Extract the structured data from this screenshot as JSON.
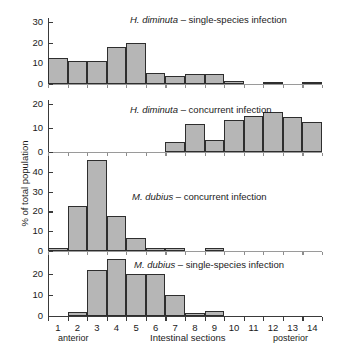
{
  "figure": {
    "ylabel": "% of total population",
    "xlabel": "Intestinal sections",
    "anterior_label": "anterior",
    "posterior_label": "posterior",
    "bar_fill": "#b6b6b6",
    "bar_stroke": "#2e2e2e",
    "axis_color": "#3a3a3a"
  },
  "chart_data": [
    {
      "type": "bar",
      "title": "H. diminuta – single-species infection",
      "title_italic": "H. diminuta",
      "title_rest": " – single-species infection",
      "xlabel": "Intestinal sections",
      "ylabel": "% of total population",
      "categories": [
        "1",
        "2",
        "3",
        "4",
        "5",
        "6",
        "7",
        "8",
        "9",
        "10",
        "11",
        "12",
        "13",
        "14"
      ],
      "values": [
        12.5,
        11.3,
        11.3,
        17.8,
        20.0,
        5.2,
        4.1,
        5.0,
        5.0,
        1.5,
        0,
        1.0,
        0,
        1.0
      ],
      "ylim": [
        0,
        30
      ],
      "yticks": [
        0,
        10,
        20,
        30
      ],
      "grid": false
    },
    {
      "type": "bar",
      "title": "H. diminuta – concurrent infection",
      "title_italic": "H. diminuta",
      "title_rest": " – concurrent infection",
      "xlabel": "Intestinal sections",
      "ylabel": "% of total population",
      "categories": [
        "1",
        "2",
        "3",
        "4",
        "5",
        "6",
        "7",
        "8",
        "9",
        "10",
        "11",
        "12",
        "13",
        "14"
      ],
      "values": [
        0,
        0,
        0,
        0,
        0,
        0,
        4.0,
        11.7,
        5.0,
        13.2,
        14.8,
        16.7,
        14.6,
        12.5
      ],
      "ylim": [
        0,
        20
      ],
      "yticks": [
        0,
        10,
        20
      ],
      "grid": false
    },
    {
      "type": "bar",
      "title": "M. dubius – concurrent infection",
      "title_italic": "M. dubius",
      "title_rest": " – concurrent infection",
      "xlabel": "Intestinal sections",
      "ylabel": "% of total population",
      "categories": [
        "1",
        "2",
        "3",
        "4",
        "5",
        "6",
        "7",
        "8",
        "9",
        "10",
        "11",
        "12",
        "13",
        "14"
      ],
      "values": [
        1.5,
        22.8,
        46.0,
        17.5,
        6.5,
        1.7,
        1.7,
        0,
        1.5,
        0,
        0,
        0,
        0,
        0
      ],
      "ylim": [
        0,
        46
      ],
      "yticks": [
        0,
        10,
        20,
        30,
        40
      ],
      "grid": false
    },
    {
      "type": "bar",
      "title": "M. dubius – single-species infection",
      "title_italic": "M. dubius",
      "title_rest": " – single-species infection",
      "xlabel": "Intestinal sections",
      "ylabel": "% of total population",
      "categories": [
        "1",
        "2",
        "3",
        "4",
        "5",
        "6",
        "7",
        "8",
        "9",
        "10",
        "11",
        "12",
        "13",
        "14"
      ],
      "values": [
        0,
        1.8,
        21.8,
        26.8,
        19.8,
        19.8,
        9.8,
        1.5,
        2.5,
        0,
        0,
        0,
        0,
        0
      ],
      "ylim": [
        0,
        27
      ],
      "yticks": [
        0,
        10,
        20
      ],
      "grid": false
    }
  ],
  "panel_ticklabels": {
    "p0": [
      "0",
      "10",
      "20",
      "30"
    ],
    "p1": [
      "0",
      "10",
      "20"
    ],
    "p2": [
      "0",
      "10",
      "20",
      "30",
      "40"
    ],
    "p3": [
      "0",
      "10",
      "20"
    ]
  },
  "xticklabels": [
    "1",
    "2",
    "3",
    "4",
    "5",
    "6",
    "7",
    "8",
    "9",
    "10",
    "11",
    "12",
    "13",
    "14"
  ]
}
